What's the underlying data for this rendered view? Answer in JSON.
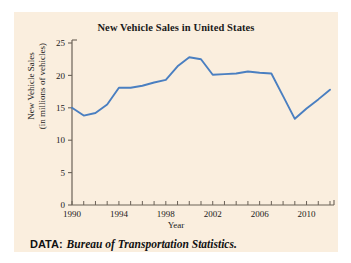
{
  "figure": {
    "background_color": "#faeede",
    "page_background": "#ffffff"
  },
  "source": {
    "label": "DATA:",
    "text": "Bureau of Transportation Statistics."
  },
  "chart_data": {
    "type": "line",
    "title": "New Vehicle Sales in United States",
    "xlabel": "Year",
    "ylabel": "New Vehicle Sales",
    "ylabel_line1": "New Vehicle Sales",
    "ylabel_line2": "(in millions of vehicles)",
    "ylabel_full": "New Vehicle Sales (in millions of vehicles)",
    "xlim": [
      1990,
      2012
    ],
    "ylim": [
      0,
      25
    ],
    "grid": false,
    "legend": false,
    "line_color": "#4a7fc1",
    "axis_color": "#6b6257",
    "x_major_ticks": [
      1990,
      1994,
      1998,
      2002,
      2006,
      2010
    ],
    "x_major_tick_labels": [
      "1990",
      "1994",
      "1998",
      "2002",
      "2006",
      "2010"
    ],
    "x_minor_tick_step": 1,
    "y_ticks": [
      0,
      5,
      10,
      15,
      20,
      25
    ],
    "y_tick_labels": [
      "0",
      "5",
      "10",
      "15",
      "20",
      "25"
    ],
    "x": [
      1990,
      1991,
      1992,
      1993,
      1994,
      1995,
      1996,
      1997,
      1998,
      1999,
      2000,
      2001,
      2002,
      2003,
      2004,
      2005,
      2006,
      2007,
      2008,
      2009,
      2010,
      2011,
      2012
    ],
    "values": [
      15.0,
      13.8,
      14.2,
      15.5,
      18.1,
      18.1,
      18.4,
      18.9,
      19.3,
      21.4,
      22.8,
      22.5,
      20.1,
      20.2,
      20.3,
      20.6,
      20.4,
      20.3,
      16.8,
      13.3,
      14.9,
      16.3,
      17.8
    ],
    "series": [
      {
        "name": "New Vehicle Sales",
        "color": "#4a7fc1",
        "values": [
          15.0,
          13.8,
          14.2,
          15.5,
          18.1,
          18.1,
          18.4,
          18.9,
          19.3,
          21.4,
          22.8,
          22.5,
          20.1,
          20.2,
          20.3,
          20.6,
          20.4,
          20.3,
          16.8,
          13.3,
          14.9,
          16.3,
          17.8
        ]
      }
    ]
  }
}
